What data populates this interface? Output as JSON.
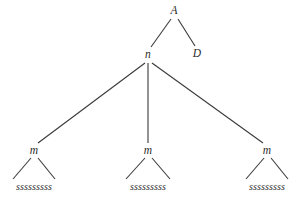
{
  "figure": {
    "kind": "syntax-tree",
    "background_color": "#ffffff",
    "line_color": "#3a3a3a",
    "text_color": "#2b2b2b",
    "width": 296,
    "height": 202
  },
  "nodes": {
    "root": {
      "label": "A",
      "x": 174,
      "y": 11
    },
    "n": {
      "label": "n",
      "x": 148,
      "y": 55
    },
    "d": {
      "label": "D",
      "x": 197,
      "y": 54
    },
    "m1": {
      "label": "m",
      "x": 34,
      "y": 151
    },
    "m2": {
      "label": "m",
      "x": 148,
      "y": 151
    },
    "m3": {
      "label": "m",
      "x": 267,
      "y": 151
    },
    "s1": {
      "label": "sssssssss",
      "x": 34,
      "y": 187
    },
    "s2": {
      "label": "sssssssss",
      "x": 148,
      "y": 187
    },
    "s3": {
      "label": "sssssssss",
      "x": 267,
      "y": 187
    }
  },
  "edges": [
    {
      "name": "edge-A-n",
      "from": "A",
      "to": "n",
      "x1": 171,
      "y1": 19,
      "x2": 151,
      "y2": 47
    },
    {
      "name": "edge-A-D",
      "from": "A",
      "to": "D",
      "x1": 178,
      "y1": 19,
      "x2": 195,
      "y2": 46
    },
    {
      "name": "edge-n-m1",
      "from": "n",
      "to": "m",
      "x1": 145,
      "y1": 63,
      "x2": 38,
      "y2": 143
    },
    {
      "name": "edge-n-m2",
      "from": "n",
      "to": "m",
      "x1": 148,
      "y1": 63,
      "x2": 148,
      "y2": 143
    },
    {
      "name": "edge-n-m3",
      "from": "n",
      "to": "m",
      "x1": 152,
      "y1": 63,
      "x2": 263,
      "y2": 143
    },
    {
      "name": "edge-m1-left",
      "from": "m",
      "to": "sssssssss",
      "x1": 31,
      "y1": 158,
      "x2": 13,
      "y2": 179
    },
    {
      "name": "edge-m1-right",
      "from": "m",
      "to": "sssssssss",
      "x1": 38,
      "y1": 158,
      "x2": 55,
      "y2": 179
    },
    {
      "name": "edge-m2-left",
      "from": "m",
      "to": "sssssssss",
      "x1": 145,
      "y1": 158,
      "x2": 126,
      "y2": 179
    },
    {
      "name": "edge-m2-right",
      "from": "m",
      "to": "sssssssss",
      "x1": 152,
      "y1": 158,
      "x2": 170,
      "y2": 179
    },
    {
      "name": "edge-m3-left",
      "from": "m",
      "to": "sssssssss",
      "x1": 264,
      "y1": 158,
      "x2": 246,
      "y2": 179
    },
    {
      "name": "edge-m3-right",
      "from": "m",
      "to": "sssssssss",
      "x1": 271,
      "y1": 158,
      "x2": 288,
      "y2": 179
    }
  ]
}
